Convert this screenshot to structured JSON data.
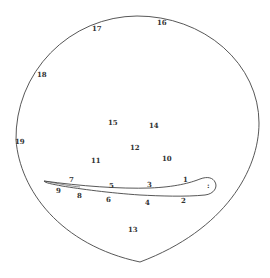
{
  "diagram": {
    "type": "circle with airfoil-shaped figure and numbered measurement points",
    "stroke_color": "#444444",
    "label_color": "#333333",
    "labels": [
      {
        "id": "1",
        "text": "1",
        "x": 183,
        "y": 176
      },
      {
        "id": "2",
        "text": "2",
        "x": 181,
        "y": 197
      },
      {
        "id": "3",
        "text": "3",
        "x": 147,
        "y": 181
      },
      {
        "id": "4",
        "text": "4",
        "x": 145,
        "y": 199
      },
      {
        "id": "5",
        "text": "5",
        "x": 109,
        "y": 182
      },
      {
        "id": "6",
        "text": "6",
        "x": 106,
        "y": 196
      },
      {
        "id": "7",
        "text": "7",
        "x": 69,
        "y": 176
      },
      {
        "id": "8",
        "text": "8",
        "x": 77,
        "y": 192
      },
      {
        "id": "9",
        "text": "9",
        "x": 56,
        "y": 187
      },
      {
        "id": "10",
        "text": "10",
        "x": 162,
        "y": 155
      },
      {
        "id": "11",
        "text": "11",
        "x": 91,
        "y": 157
      },
      {
        "id": "12",
        "text": "12",
        "x": 130,
        "y": 144
      },
      {
        "id": "13",
        "text": "13",
        "x": 128,
        "y": 226
      },
      {
        "id": "14",
        "text": "14",
        "x": 149,
        "y": 122
      },
      {
        "id": "15",
        "text": "15",
        "x": 108,
        "y": 119
      },
      {
        "id": "16",
        "text": "16",
        "x": 157,
        "y": 19
      },
      {
        "id": "17",
        "text": "17",
        "x": 92,
        "y": 25
      },
      {
        "id": "18",
        "text": "18",
        "x": 37,
        "y": 71
      },
      {
        "id": "19",
        "text": "19",
        "x": 15,
        "y": 138
      }
    ],
    "tip_mark": ":"
  }
}
